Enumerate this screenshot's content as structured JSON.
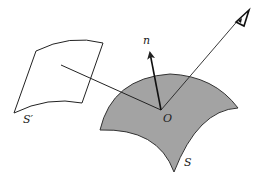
{
  "diagram": {
    "labels": {
      "normal": "n",
      "origin": "O",
      "surface": "S",
      "projected_surface": "S′"
    },
    "colors": {
      "background": "#ffffff",
      "surface_fill": "#a3a3a3",
      "stroke": "#222222"
    },
    "icons": {
      "viewer": "eye-icon"
    }
  }
}
